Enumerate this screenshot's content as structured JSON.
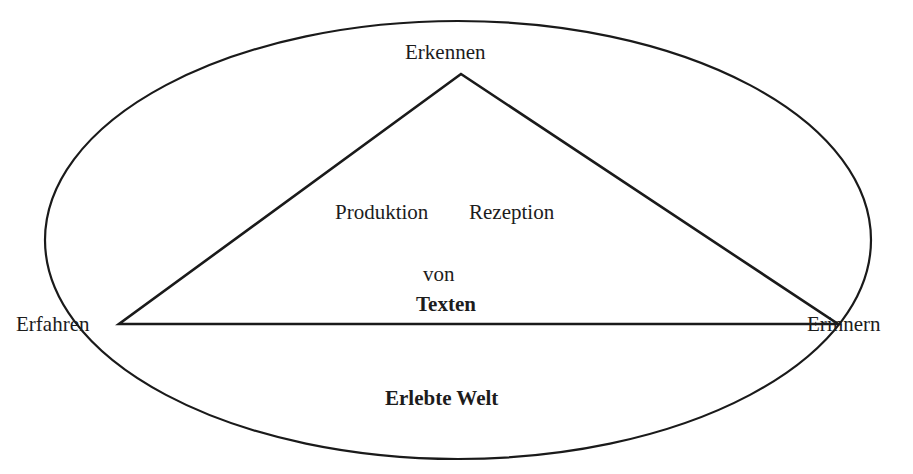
{
  "diagram": {
    "type": "triangle-in-ellipse",
    "stroke_color": "#1a1a1a",
    "background": "#ffffff",
    "ellipse": {
      "label": "Erlebte Welt",
      "cx": 458,
      "cy": 240,
      "rx": 413,
      "ry": 219
    },
    "triangle": {
      "apex": [
        461,
        74
      ],
      "left": [
        119,
        324
      ],
      "right": [
        838,
        324
      ]
    },
    "vertices": {
      "top": "Erkennen",
      "left": "Erfahren",
      "right": "Erinnern"
    },
    "center": {
      "line1_left": "Produktion",
      "line1_right": "Rezeption",
      "line2": "von",
      "line3": "Texten"
    }
  }
}
